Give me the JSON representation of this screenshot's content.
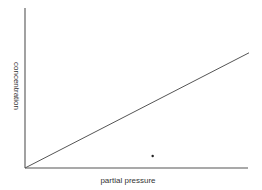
{
  "chart_data": {
    "type": "line",
    "title": "",
    "xlabel": "partial pressure",
    "ylabel": "concentration",
    "grid": false,
    "legend": null,
    "x_ticks": [],
    "y_ticks": [],
    "series": [
      {
        "name": "concentration vs partial pressure",
        "x": [
          0,
          1
        ],
        "y": [
          0,
          0.72
        ]
      }
    ],
    "xlim": [
      0,
      1
    ],
    "ylim": [
      0,
      1
    ],
    "annotations": [
      {
        "type": "dot",
        "x": 0.57,
        "y": 0.075
      }
    ]
  },
  "colors": {
    "axis": "#555555",
    "line": "#555555",
    "text": "#333333",
    "background": "#ffffff"
  }
}
